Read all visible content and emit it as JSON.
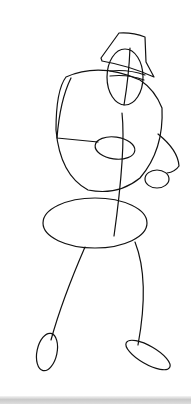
{
  "drawing": {
    "subject": "stick-figure sketch with hat",
    "stroke_color": "#111111",
    "background_color": "#ffffff",
    "bottom_bar_color": "#cccccc"
  }
}
